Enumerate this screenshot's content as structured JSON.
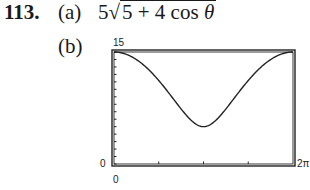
{
  "problem": {
    "number": "113.",
    "part_a_label": "(a)",
    "part_a_coef": "5",
    "part_a_radical_sign": "√",
    "part_a_radicand": "5 + 4 cos ",
    "part_a_theta": "θ",
    "part_b_label": "(b)"
  },
  "chart_data": {
    "type": "line",
    "title": "",
    "function": "r = 5*sqrt(5 + 4*cos(theta))",
    "xlabel": "",
    "ylabel": "",
    "xlim": [
      0,
      6.2832
    ],
    "ylim": [
      0,
      15
    ],
    "x_tick_labels": {
      "left": "0",
      "right": "2π"
    },
    "y_tick_labels": {
      "top": "15",
      "bottom": "0"
    },
    "x": [
      0,
      0.7854,
      1.5708,
      2.3562,
      3.1416,
      3.927,
      4.7124,
      5.4978,
      6.2832
    ],
    "values": [
      15,
      14.05,
      11.18,
      7.93,
      5,
      7.93,
      11.18,
      14.05,
      15
    ],
    "grid": false,
    "legend": null
  }
}
